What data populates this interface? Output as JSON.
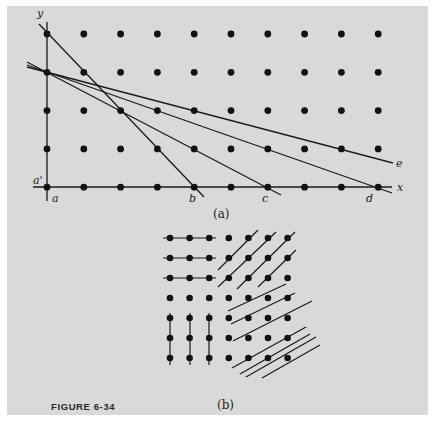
{
  "figure": {
    "label": "FIGURE 6-34",
    "panel_a": {
      "caption": "(a)",
      "axis_labels": {
        "y": "y",
        "x": "x"
      },
      "point_labels": {
        "a_prime": "a'",
        "a": "a",
        "b": "b",
        "c": "c",
        "d": "d",
        "e": "e"
      },
      "grid": {
        "columns": 10,
        "rows": 5
      },
      "lines": [
        {
          "name": "line-to-b",
          "from": "a' (0,3)",
          "to": "b (4,0)"
        },
        {
          "name": "line-to-c",
          "from": "a' (0,3)",
          "to": "c (6,0)"
        },
        {
          "name": "line-to-d",
          "from": "a' (0,3)",
          "to": "d (9,0)"
        },
        {
          "name": "line-to-e",
          "from": "a' (0,3)",
          "to": "e"
        }
      ]
    },
    "panel_b": {
      "caption": "(b)",
      "grid": {
        "columns": 7,
        "rows": 7
      },
      "regions": [
        "horizontal lines (top-left 3x3)",
        "diagonal lines (top-right)",
        "vertical lines (bottom-left 3x3)",
        "shallow diagonal lines (bottom-right)"
      ]
    }
  }
}
